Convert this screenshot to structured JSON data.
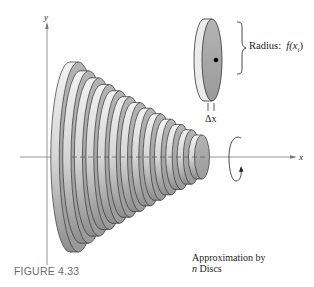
{
  "figure": {
    "caption": "FIGURE 4.33",
    "axes": {
      "y_label": "y",
      "x_label": "x"
    },
    "single_disc": {
      "radius_label_prefix": "Radius:",
      "radius_label_func": "f(x",
      "radius_label_sub": "i",
      "radius_label_close": ")",
      "width_label": "Δx"
    },
    "annotation": {
      "line1": "Approximation by",
      "line2_var": "n",
      "line2_text": " Discs"
    },
    "stack": {
      "disc_count": 13
    },
    "colors": {
      "disc_face": "#a9a9a9",
      "disc_rim": "#e4e4e4",
      "outline": "#333333",
      "axis": "#777777"
    },
    "icons": {
      "rotation": "rotation-arrow-icon",
      "brace": "right-brace-icon"
    }
  }
}
